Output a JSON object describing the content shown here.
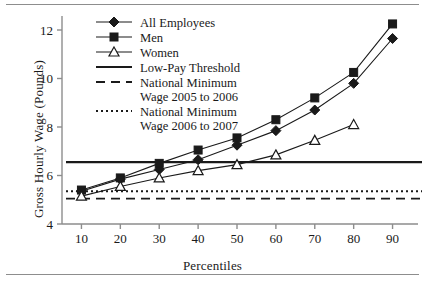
{
  "chart_data": {
    "type": "line",
    "title": "",
    "xlabel": "Percentiles",
    "ylabel": "Gross Hourly Wage (Pounds)",
    "x": [
      10,
      20,
      30,
      40,
      50,
      60,
      70,
      80,
      90
    ],
    "xlim": [
      5,
      95
    ],
    "ylim": [
      4,
      12.6
    ],
    "xticks": [
      10,
      20,
      30,
      40,
      50,
      60,
      70,
      80,
      90
    ],
    "yticks": [
      4,
      6,
      8,
      10,
      12
    ],
    "grid": false,
    "legend_position": "top-left-inside",
    "series": [
      {
        "name": "All Employees",
        "marker": "filled-diamond",
        "style": "solid",
        "x": [
          10,
          20,
          30,
          40,
          50,
          60,
          70,
          80,
          90
        ],
        "values": [
          5.35,
          5.85,
          6.25,
          6.65,
          7.25,
          7.85,
          8.7,
          9.8,
          11.65
        ]
      },
      {
        "name": "Men",
        "marker": "filled-square",
        "style": "solid",
        "x": [
          10,
          20,
          30,
          40,
          50,
          60,
          70,
          80,
          90
        ],
        "values": [
          5.4,
          5.9,
          6.5,
          7.05,
          7.55,
          8.3,
          9.2,
          10.25,
          12.25
        ]
      },
      {
        "name": "Women",
        "marker": "open-triangle",
        "style": "solid",
        "x": [
          10,
          20,
          30,
          40,
          50,
          60,
          70,
          80
        ],
        "values": [
          5.15,
          5.55,
          5.9,
          6.2,
          6.45,
          6.85,
          7.45,
          8.1
        ]
      }
    ],
    "reference_lines": [
      {
        "name": "Low-Pay Threshold",
        "style": "solid",
        "value": 6.55
      },
      {
        "name": "National Minimum Wage 2005 to 2006",
        "style": "dashed",
        "value": 5.05
      },
      {
        "name": "National Minimum Wage 2006 to 2007",
        "style": "dotted",
        "value": 5.35
      }
    ],
    "legend": [
      {
        "label": "All Employees",
        "marker": "filled-diamond",
        "style": "solid"
      },
      {
        "label": "Men",
        "marker": "filled-square",
        "style": "solid"
      },
      {
        "label": "Women",
        "marker": "open-triangle",
        "style": "solid"
      },
      {
        "label": "Low-Pay Threshold",
        "marker": "none",
        "style": "solid"
      },
      {
        "label": "National Minimum",
        "label2": "Wage 2005 to 2006",
        "marker": "none",
        "style": "dashed"
      },
      {
        "label": "National Minimum",
        "label2": "Wage 2006 to 2007",
        "marker": "none",
        "style": "dotted"
      }
    ]
  },
  "axis": {
    "ylabel": "Gross Hourly Wage (Pounds)",
    "xlabel": "Percentiles",
    "ytick_labels": [
      "4",
      "6",
      "8",
      "10",
      "12"
    ],
    "xtick_labels": [
      "10",
      "20",
      "30",
      "40",
      "50",
      "60",
      "70",
      "80",
      "90"
    ]
  },
  "legend": {
    "item0": "All Employees",
    "item1": "Men",
    "item2": "Women",
    "item3": "Low-Pay Threshold",
    "item4_line1": "National Minimum",
    "item4_line2": "Wage 2005 to 2006",
    "item5_line1": "National Minimum",
    "item5_line2": "Wage 2006 to 2007"
  },
  "colors": {
    "ink": "#1a1a1a",
    "axis": "#8d8d8d",
    "rule": "#8d8d8d"
  }
}
